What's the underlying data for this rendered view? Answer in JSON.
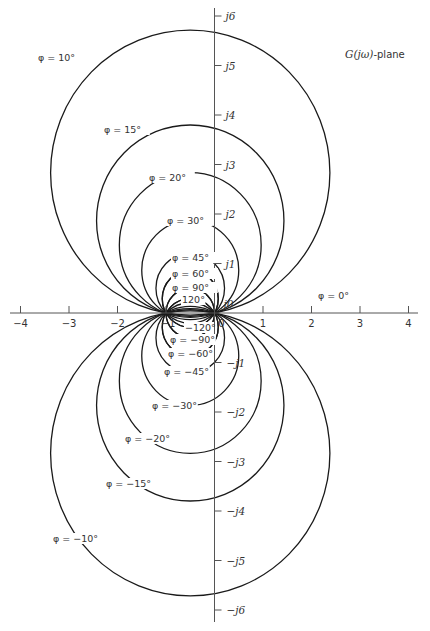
{
  "title": "G(jω)-plane",
  "title_parts": {
    "G": "G",
    "arg": "(jω)",
    "suffix": "-plane"
  },
  "chart_data": {
    "type": "diagram",
    "x_axis": {
      "ticks": [
        -4,
        -3,
        -2,
        -1,
        0,
        1,
        2,
        3,
        4
      ],
      "tick_labels": [
        "−4",
        "−3",
        "−2",
        "−1",
        "0",
        "1",
        "2",
        "3",
        "4"
      ],
      "range": [
        -4.3,
        4.3
      ]
    },
    "y_axis": {
      "ticks": [
        6,
        5,
        4,
        3,
        2,
        1,
        0,
        -1,
        -2,
        -3,
        -4,
        -5,
        -6
      ],
      "tick_labels": [
        "j6",
        "j5",
        "j4",
        "j3",
        "j2",
        "j1",
        "j0",
        "−j1",
        "−j2",
        "−j3",
        "−j4",
        "−j5",
        "−j6"
      ],
      "range": [
        -6.3,
        6.3
      ]
    },
    "circles": [
      {
        "phi": 10,
        "label": "φ =  10°",
        "lx": 38,
        "ly": 61
      },
      {
        "phi": 15,
        "label": "φ =  15°",
        "lx": 104,
        "ly": 133
      },
      {
        "phi": 20,
        "label": "φ =  20°",
        "lx": 149,
        "ly": 181
      },
      {
        "phi": 30,
        "label": "φ =  30°",
        "lx": 167,
        "ly": 224
      },
      {
        "phi": 45,
        "label": "φ =  45°",
        "lx": 172,
        "ly": 261
      },
      {
        "phi": 60,
        "label": "φ =  60°",
        "lx": 172,
        "ly": 277
      },
      {
        "phi": 90,
        "label": "φ =  90°",
        "lx": 172,
        "ly": 291
      },
      {
        "phi": 120,
        "label": "120°",
        "lx": 182,
        "ly": 303
      },
      {
        "phi": -120,
        "label": "−120°",
        "lx": 185,
        "ly": 331
      },
      {
        "phi": -90,
        "label": "φ = −90°",
        "lx": 170,
        "ly": 343
      },
      {
        "phi": -60,
        "label": "φ = −60°",
        "lx": 168,
        "ly": 357
      },
      {
        "phi": -45,
        "label": "φ = −45°",
        "lx": 164,
        "ly": 375
      },
      {
        "phi": -30,
        "label": "φ = −30°",
        "lx": 152,
        "ly": 409
      },
      {
        "phi": -20,
        "label": "φ = −20°",
        "lx": 125,
        "ly": 442
      },
      {
        "phi": -15,
        "label": "φ = −15°",
        "lx": 106,
        "ly": 487
      },
      {
        "phi": -10,
        "label": "φ = −10°",
        "lx": 53,
        "ly": 542
      }
    ],
    "zero_label": {
      "label": "φ =  0°",
      "lx": 318,
      "ly": 299
    },
    "grid": false
  },
  "axis_labels": {
    "minus_one": "−1",
    "zero": "0",
    "j0": "j0"
  }
}
